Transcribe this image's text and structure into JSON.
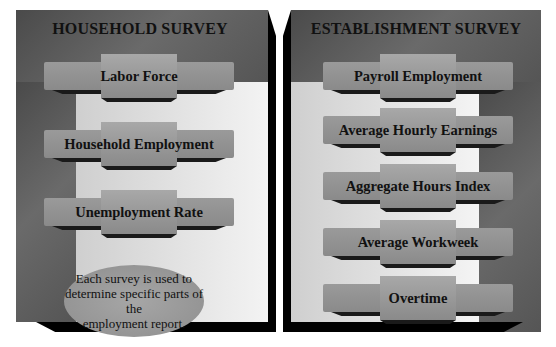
{
  "household": {
    "title": "HOUSEHOLD SURVEY",
    "items": [
      "Labor Force",
      "Household Employment",
      "Unemployment Rate"
    ],
    "note_lines": [
      "Each survey is used to",
      "determine specific parts of the",
      "employment report."
    ]
  },
  "establishment": {
    "title": "ESTABLISHMENT SURVEY",
    "items": [
      "Payroll Employment",
      "Average Hourly Earnings",
      "Aggregate Hours Index",
      "Average Workweek",
      "Overtime"
    ]
  }
}
